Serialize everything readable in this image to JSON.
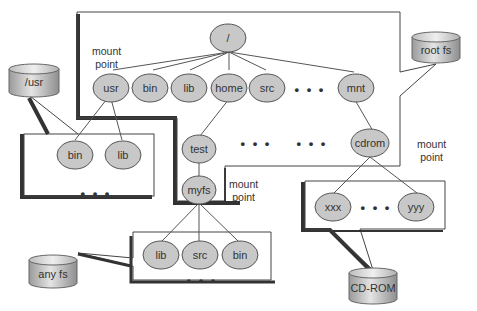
{
  "diagram": {
    "type": "file-system mount tree",
    "colors": {
      "node_fill": "#c8c8c8",
      "node_stroke": "#555555",
      "box_stroke": "#444444",
      "box_shadow": "#333333",
      "disk_fill": "#b9b9b9",
      "text": "#333333"
    },
    "disks": {
      "root_fs": "root fs",
      "usr": "/usr",
      "any_fs": "any fs",
      "cdrom": "CD-ROM"
    },
    "root_tree": {
      "root": "/",
      "children": [
        "usr",
        "bin",
        "lib",
        "home",
        "src",
        "mnt"
      ],
      "ellipsis": "• • •",
      "home_child": "test",
      "test_child": "myfs",
      "mnt_child": "cdrom",
      "ellipsis_mid_1": "• • •",
      "ellipsis_mid_2": "• • •"
    },
    "usr_tree": {
      "children": [
        "bin",
        "lib"
      ],
      "ellipsis": "• • •"
    },
    "myfs_tree": {
      "children": [
        "lib",
        "src",
        "bin"
      ],
      "ellipsis": "• • •"
    },
    "cdrom_tree": {
      "children": [
        "xxx",
        "yyy"
      ],
      "ellipsis": "• • •"
    },
    "labels": {
      "mount_point_usr": [
        "mount",
        "point"
      ],
      "mount_point_myfs": [
        "mount",
        "point"
      ],
      "mount_point_cdrom": [
        "mount",
        "point"
      ]
    }
  }
}
